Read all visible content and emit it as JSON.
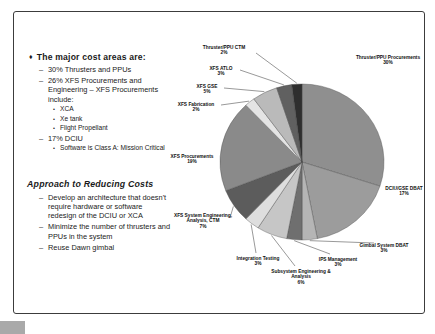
{
  "left_panel": {
    "section1": {
      "bullet": "♦",
      "heading": "The major cost areas are:",
      "items": [
        {
          "marker": "–",
          "level": 1,
          "text": "30% Thrusters and PPUs"
        },
        {
          "marker": "–",
          "level": 1,
          "text": "26% XFS Procurements and Engineering – XFS Procurements include:"
        },
        {
          "marker": "•",
          "level": 2,
          "text": "XCA"
        },
        {
          "marker": "•",
          "level": 2,
          "text": "Xe tank"
        },
        {
          "marker": "•",
          "level": 2,
          "text": "Flight Propellant"
        },
        {
          "marker": "–",
          "level": 1,
          "text": "17% DCIU"
        },
        {
          "marker": "•",
          "level": 2,
          "text": "Software is Class A: Mission Critical"
        }
      ]
    },
    "section2": {
      "heading": "Approach to Reducing Costs",
      "items": [
        {
          "marker": "–",
          "level": 1,
          "text": "Develop an architecture that doesn't require hardware or software redesign of the DCIU or XCA"
        },
        {
          "marker": "–",
          "level": 1,
          "text": "Minimize the number of thrusters and PPUs in the system"
        },
        {
          "marker": "–",
          "level": 1,
          "text": "Reuse Dawn gimbal"
        }
      ]
    }
  },
  "chart_data": {
    "type": "pie",
    "title": "",
    "unit": "%",
    "total": 100,
    "layout": {
      "cx": 302,
      "cy": 162,
      "rx": 82,
      "ry": 78,
      "start_angle_deg": 0,
      "direction": "clockwise",
      "label_font_size": 4.8,
      "label_line_height": 5.6,
      "stroke_color": "#4a4a4a",
      "leader_color": "#333333"
    },
    "slices": [
      {
        "label": "Thruster/PPU Procurements",
        "value": 30,
        "color": "#8f8f8f",
        "label_lines": [
          "Thruster/PPU Procurements"
        ],
        "label_pos": [
          388,
          53
        ],
        "leader": false
      },
      {
        "label": "DCIU/GSE DBAT",
        "value": 17,
        "color": "#9c9c9c",
        "label_lines": [
          "DCIU/GSE DBAT"
        ],
        "label_pos": [
          404,
          184
        ],
        "leader": false
      },
      {
        "label": "Gimbal System DBAT",
        "value": 3,
        "color": "#b5b5b5",
        "label_lines": [
          "Gimbal System DBAT"
        ],
        "label_pos": [
          384,
          241
        ],
        "leader": true,
        "leader_from": [
          374,
          243
        ]
      },
      {
        "label": "IPS Management",
        "value": 3,
        "color": "#6f6f6f",
        "label_lines": [
          "IPS Management"
        ],
        "label_pos": [
          338,
          255
        ],
        "leader": true,
        "leader_from": [
          330,
          254
        ]
      },
      {
        "label": "Subsystem Engineering & Analysis",
        "value": 6,
        "color": "#c6c6c6",
        "label_lines": [
          "Subsystem Engineering &",
          "Analysis"
        ],
        "label_pos": [
          301,
          267
        ],
        "leader": true,
        "leader_from": [
          295,
          266
        ]
      },
      {
        "label": "Integration Testing",
        "value": 3,
        "color": "#dedede",
        "label_lines": [
          "Integration Testing"
        ],
        "label_pos": [
          258,
          254
        ],
        "leader": true,
        "leader_from": [
          256,
          253
        ]
      },
      {
        "label": "XFS System Engineering, Analysis, CTM",
        "value": 7,
        "color": "#5c5c5c",
        "label_lines": [
          "XFS System Engineering,",
          "Analysis, CTM"
        ],
        "label_pos": [
          203,
          211
        ],
        "leader": true,
        "leader_from": [
          230,
          218
        ]
      },
      {
        "label": "XFS Procurements",
        "value": 19,
        "color": "#8a8a8a",
        "label_lines": [
          "XFS Procurements"
        ],
        "label_pos": [
          192,
          152
        ],
        "leader": false
      },
      {
        "label": "XFS Fabrication",
        "value": 2,
        "color": "#e4e4e4",
        "label_lines": [
          "XFS Fabrication"
        ],
        "label_pos": [
          196,
          100
        ],
        "leader": true,
        "leader_from": [
          221,
          105
        ]
      },
      {
        "label": "XFS GSE",
        "value": 5,
        "color": "#bababa",
        "label_lines": [
          "XFS GSE"
        ],
        "label_pos": [
          207,
          82
        ],
        "leader": true,
        "leader_from": [
          224,
          88
        ]
      },
      {
        "label": "XFS ATLO",
        "value": 3,
        "color": "#606060",
        "label_lines": [
          "XFS ATLO"
        ],
        "label_pos": [
          221,
          64
        ],
        "leader": true,
        "leader_from": [
          240,
          70
        ]
      },
      {
        "label": "Thruster/PPU CTM",
        "value": 2,
        "color": "#2e2e2e",
        "label_lines": [
          "Thruster/PPU CTM"
        ],
        "label_pos": [
          224,
          43
        ],
        "leader": true,
        "leader_from": [
          256,
          53
        ]
      }
    ]
  },
  "artifacts": {
    "bottom_left_box": ""
  }
}
